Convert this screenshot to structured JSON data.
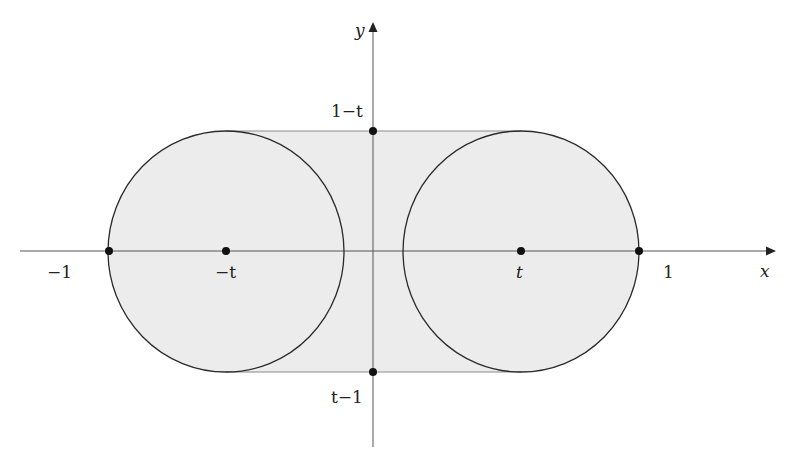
{
  "diagram": {
    "title": "",
    "colors": {
      "region_fill": "#ececec",
      "circle_stroke": "#2a2a2a",
      "tangent_stroke": "#8a8a8a",
      "axis_stroke": "#555555",
      "point_fill": "#111111"
    },
    "axes": {
      "x_label": "x",
      "y_label": "y"
    },
    "labels": {
      "neg_one": "−1",
      "neg_t": "−t",
      "t": "t",
      "one": "1",
      "one_minus_t": "1−t",
      "t_minus_one": "t−1"
    },
    "shapes": {
      "left_circle": {
        "center": "-t",
        "radius": "1-t"
      },
      "right_circle": {
        "center": "t",
        "radius": "1-t"
      },
      "region": "stadium (convex hull of both circles), shaded"
    },
    "points": [
      {
        "name": "-1",
        "x": -1,
        "y": 0
      },
      {
        "name": "-t",
        "x": "-t",
        "y": 0
      },
      {
        "name": "t",
        "x": "t",
        "y": 0
      },
      {
        "name": "1",
        "x": 1,
        "y": 0
      },
      {
        "name": "1-t",
        "x": 0,
        "y": "1-t"
      },
      {
        "name": "t-1",
        "x": 0,
        "y": "t-1"
      }
    ]
  }
}
